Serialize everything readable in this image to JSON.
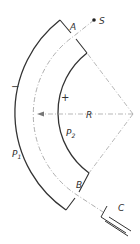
{
  "diagram": {
    "labels": {
      "entrance": "A",
      "exit": "B",
      "source": "S",
      "collector": "C",
      "radius": "R",
      "outer_plate": "P1",
      "inner_plate": "P2",
      "outer_polarity": "−",
      "inner_polarity": "+"
    },
    "geometry": {
      "center": [
        133,
        114
      ],
      "outer_radius": 118,
      "inner_radius": 75,
      "mean_radius": 96
    },
    "colors": {
      "plate": "#333333",
      "path": "#999999",
      "background": "#ffffff"
    }
  }
}
